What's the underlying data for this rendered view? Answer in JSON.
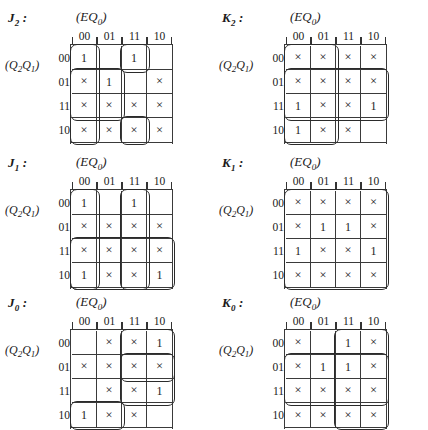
{
  "page": {
    "symbols": {
      "one": "1",
      "dontcare": "×",
      "blank": ""
    },
    "col_header_label": "(EQ₀)",
    "row_header_label": "(Q₂Q₁)",
    "col_values": [
      "00",
      "01",
      "11",
      "10"
    ],
    "row_values": [
      "00",
      "01",
      "11",
      "10"
    ]
  },
  "maps": [
    {
      "id": "j2",
      "title": "J₂ :",
      "col_header": "(EQ₀)",
      "row_header": "(Q₂Q₁)",
      "cols": [
        "00",
        "01",
        "11",
        "10"
      ],
      "rows": [
        "00",
        "01",
        "11",
        "10"
      ],
      "cells": [
        [
          "1",
          "",
          "1",
          ""
        ],
        [
          "×",
          "1",
          "",
          "×"
        ],
        [
          "×",
          "×",
          "×",
          "×"
        ],
        [
          "×",
          "×",
          "×",
          "×"
        ]
      ],
      "groups": [
        {
          "name": "loop-col00-all-rows",
          "row": 0,
          "col": 0,
          "rowspan": 4,
          "colspan": 1
        },
        {
          "name": "loop-rows01-11-cols00-01",
          "row": 1,
          "col": 0,
          "rowspan": 2,
          "colspan": 2
        },
        {
          "name": "loop-row00-col11",
          "row": 0,
          "col": 2,
          "rowspan": 1,
          "colspan": 1
        },
        {
          "name": "loop-row10-col11",
          "row": 3,
          "col": 2,
          "rowspan": 1,
          "colspan": 1
        }
      ]
    },
    {
      "id": "k2",
      "title": "K₂ :",
      "col_header": "(EQ₀)",
      "row_header": "(Q₂Q₁)",
      "cols": [
        "00",
        "01",
        "11",
        "10"
      ],
      "rows": [
        "00",
        "01",
        "11",
        "10"
      ],
      "cells": [
        [
          "×",
          "×",
          "×",
          "×"
        ],
        [
          "×",
          "×",
          "×",
          "×"
        ],
        [
          "1",
          "×",
          "×",
          "1"
        ],
        [
          "1",
          "×",
          "×",
          ""
        ]
      ],
      "groups": [
        {
          "name": "loop-cols00-01-all-rows",
          "row": 0,
          "col": 0,
          "rowspan": 4,
          "colspan": 2
        },
        {
          "name": "loop-rows01-11-all-cols",
          "row": 1,
          "col": 0,
          "rowspan": 2,
          "colspan": 4
        }
      ]
    },
    {
      "id": "j1",
      "title": "J₁ :",
      "col_header": "(EQ₀)",
      "row_header": "(Q₂Q₁)",
      "cols": [
        "00",
        "01",
        "11",
        "10"
      ],
      "rows": [
        "00",
        "01",
        "11",
        "10"
      ],
      "cells": [
        [
          "1",
          "",
          "1",
          ""
        ],
        [
          "×",
          "×",
          "×",
          "×"
        ],
        [
          "×",
          "×",
          "×",
          "×"
        ],
        [
          "1",
          "×",
          "×",
          "1"
        ]
      ],
      "groups": [
        {
          "name": "loop-col00-rows00-10",
          "row": 0,
          "col": 0,
          "rowspan": 4,
          "colspan": 1
        },
        {
          "name": "loop-col11-rows00-10",
          "row": 0,
          "col": 2,
          "rowspan": 4,
          "colspan": 1
        },
        {
          "name": "loop-rows11-10-all-cols",
          "row": 2,
          "col": 0,
          "rowspan": 2,
          "colspan": 4
        }
      ]
    },
    {
      "id": "k1",
      "title": "K₁ :",
      "col_header": "(EQ₀)",
      "row_header": "(Q₂Q₁)",
      "cols": [
        "00",
        "01",
        "11",
        "10"
      ],
      "rows": [
        "00",
        "01",
        "11",
        "10"
      ],
      "cells": [
        [
          "×",
          "×",
          "×",
          "×"
        ],
        [
          "×",
          "1",
          "1",
          "×"
        ],
        [
          "1",
          "×",
          "×",
          "1"
        ],
        [
          "×",
          "×",
          "×",
          "×"
        ]
      ],
      "groups": [
        {
          "name": "loop-entire-map",
          "row": 0,
          "col": 0,
          "rowspan": 4,
          "colspan": 4
        }
      ]
    },
    {
      "id": "j0",
      "title": "J₀ :",
      "col_header": "(EQ₀)",
      "row_header": "(Q₂Q₁)",
      "cols": [
        "00",
        "01",
        "11",
        "10"
      ],
      "rows": [
        "00",
        "01",
        "11",
        "10"
      ],
      "cells": [
        [
          "",
          "×",
          "×",
          "1"
        ],
        [
          "×",
          "×",
          "×",
          "×"
        ],
        [
          "",
          "×",
          "×",
          "1"
        ],
        [
          "1",
          "×",
          "×",
          ""
        ]
      ],
      "groups": [
        {
          "name": "loop-cols11-10-rows00-11",
          "row": 0,
          "col": 2,
          "rowspan": 3,
          "colspan": 2
        },
        {
          "name": "loop-row01-cols11-10",
          "row": 1,
          "col": 2,
          "rowspan": 1,
          "colspan": 2
        },
        {
          "name": "loop-row10-cols00-01",
          "row": 3,
          "col": 0,
          "rowspan": 1,
          "colspan": 2
        }
      ]
    },
    {
      "id": "k0",
      "title": "K₀ :",
      "col_header": "(EQ₀)",
      "row_header": "(Q₂Q₁)",
      "cols": [
        "00",
        "01",
        "11",
        "10"
      ],
      "rows": [
        "00",
        "01",
        "11",
        "10"
      ],
      "cells": [
        [
          "×",
          "",
          "1",
          "×"
        ],
        [
          "×",
          "1",
          "1",
          "×"
        ],
        [
          "×",
          "×",
          "×",
          "×"
        ],
        [
          "×",
          "×",
          "×",
          "×"
        ]
      ],
      "groups": [
        {
          "name": "loop-rows01-11-cols00-10",
          "row": 1,
          "col": 0,
          "rowspan": 2,
          "colspan": 4
        },
        {
          "name": "loop-cols11-10-all-rows",
          "row": 0,
          "col": 2,
          "rowspan": 4,
          "colspan": 2
        }
      ]
    }
  ],
  "layout": {
    "positions": [
      {
        "id": "j2",
        "left": 0,
        "top": 0
      },
      {
        "id": "k2",
        "left": 214,
        "top": 0
      },
      {
        "id": "j1",
        "left": 0,
        "top": 145
      },
      {
        "id": "k1",
        "left": 214,
        "top": 145
      },
      {
        "id": "j0",
        "left": 0,
        "top": 285
      },
      {
        "id": "k0",
        "left": 214,
        "top": 285
      }
    ]
  }
}
